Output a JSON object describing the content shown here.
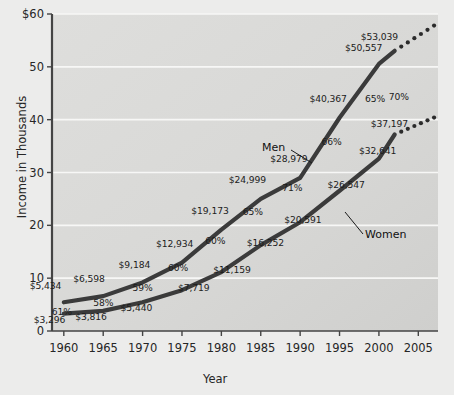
{
  "chart_data": {
    "type": "line",
    "title": "",
    "xlabel": "Year",
    "ylabel": "Income in Thousands",
    "xlim": [
      1958.5,
      2007.5
    ],
    "ylim": [
      0,
      60
    ],
    "xticks": [
      "1960",
      "1965",
      "1970",
      "1975",
      "1980",
      "1985",
      "1990",
      "1995",
      "2000",
      "2005"
    ],
    "yticks": [
      "0",
      "10",
      "20",
      "30",
      "40",
      "50",
      "$60"
    ],
    "grid": true,
    "legend_position": "inline-annotations",
    "x": [
      1960,
      1965,
      1970,
      1975,
      1980,
      1985,
      1990,
      1995,
      2000,
      2002
    ],
    "series": [
      {
        "name": "Men",
        "values": [
          5434,
          6598,
          9184,
          12934,
          19173,
          24999,
          28979,
          40367,
          50557,
          53039
        ],
        "labels": [
          "$5,434",
          "$6,598",
          "$9,184",
          "$12,934",
          "$19,173",
          "$24,999",
          "$28,979",
          "$40,367",
          "$50,557",
          "$53,039"
        ],
        "projection_x": [
          2002,
          2007
        ],
        "projection_values": [
          53039,
          57800
        ]
      },
      {
        "name": "Women",
        "values": [
          3296,
          3816,
          5440,
          7719,
          11159,
          16252,
          20591,
          26547,
          32641,
          37197
        ],
        "labels": [
          "$3,296",
          "$3,816",
          "$5,440",
          "$7,719",
          "$11,159",
          "$16,252",
          "$20,591",
          "$26,547",
          "$32,641",
          "$37,197"
        ],
        "projection_x": [
          2002,
          2007
        ],
        "projection_values": [
          37197,
          40400
        ]
      }
    ],
    "ratio_labels": [
      "61%",
      "58%",
      "59%",
      "60%",
      "60%",
      "65%",
      "71%",
      "66%",
      "65%",
      "70%"
    ],
    "annotations": [
      {
        "text": "Men",
        "for": "Men"
      },
      {
        "text": "Women",
        "for": "Women"
      }
    ]
  },
  "axes": {
    "y_title": "Income in Thousands",
    "x_title": "Year",
    "y_ticks": [
      {
        "label": "$60",
        "value": 60
      },
      {
        "label": "50",
        "value": 50
      },
      {
        "label": "40",
        "value": 40
      },
      {
        "label": "30",
        "value": 30
      },
      {
        "label": "20",
        "value": 20
      },
      {
        "label": "10",
        "value": 10
      },
      {
        "label": "0",
        "value": 0
      }
    ],
    "x_ticks": [
      {
        "label": "1960",
        "value": 1960
      },
      {
        "label": "1965",
        "value": 1965
      },
      {
        "label": "1970",
        "value": 1970
      },
      {
        "label": "1975",
        "value": 1975
      },
      {
        "label": "1980",
        "value": 1980
      },
      {
        "label": "1985",
        "value": 1985
      },
      {
        "label": "1990",
        "value": 1990
      },
      {
        "label": "1995",
        "value": 1995
      },
      {
        "label": "2000",
        "value": 2000
      },
      {
        "label": "2005",
        "value": 2005
      }
    ]
  },
  "style": {
    "line_color": "#3b3b3b",
    "plot_bg": "#d9d9d7",
    "page_bg": "#ececeb",
    "grid_color": "#f7f7f6",
    "axis_color": "#333333"
  },
  "men_label": "Men",
  "women_label": "Women"
}
